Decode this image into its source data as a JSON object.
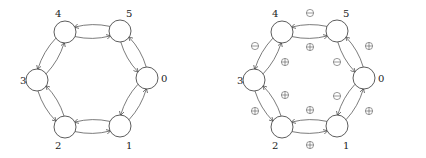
{
  "diagrams": [
    {
      "name": "unsigned-ring",
      "offset_x": 0,
      "nodes": [
        {
          "id": "0",
          "label": "0",
          "x": 147,
          "y": 78,
          "lx": 161,
          "ly": 82
        },
        {
          "id": "1",
          "label": "1",
          "x": 120,
          "y": 126,
          "lx": 126,
          "ly": 149
        },
        {
          "id": "2",
          "label": "2",
          "x": 65,
          "y": 127,
          "lx": 55,
          "ly": 149
        },
        {
          "id": "3",
          "label": "3",
          "x": 37,
          "y": 80,
          "lx": 20,
          "ly": 84
        },
        {
          "id": "4",
          "label": "4",
          "x": 65,
          "y": 32,
          "lx": 55,
          "ly": 17
        },
        {
          "id": "5",
          "label": "5",
          "x": 120,
          "y": 31,
          "lx": 126,
          "ly": 17
        }
      ],
      "edge_signs": []
    },
    {
      "name": "signed-ring",
      "offset_x": 217,
      "nodes": [
        {
          "id": "0",
          "label": "0",
          "x": 147,
          "y": 78,
          "lx": 161,
          "ly": 82
        },
        {
          "id": "1",
          "label": "1",
          "x": 120,
          "y": 126,
          "lx": 126,
          "ly": 149
        },
        {
          "id": "2",
          "label": "2",
          "x": 65,
          "y": 127,
          "lx": 55,
          "ly": 149
        },
        {
          "id": "3",
          "label": "3",
          "x": 37,
          "y": 80,
          "lx": 20,
          "ly": 84
        },
        {
          "id": "4",
          "label": "4",
          "x": 65,
          "y": 32,
          "lx": 55,
          "ly": 17
        },
        {
          "id": "5",
          "label": "5",
          "x": 120,
          "y": 31,
          "lx": 126,
          "ly": 17
        }
      ],
      "edge_signs": [
        {
          "edge": "4->5",
          "sign": "minus",
          "x": 93,
          "y": 13
        },
        {
          "edge": "5->4",
          "sign": "plus",
          "x": 93,
          "y": 47
        },
        {
          "edge": "5->0",
          "sign": "plus",
          "x": 152,
          "y": 46
        },
        {
          "edge": "0->5",
          "sign": "minus",
          "x": 120,
          "y": 62
        },
        {
          "edge": "0->1",
          "sign": "plus",
          "x": 152,
          "y": 111
        },
        {
          "edge": "1->0",
          "sign": "minus",
          "x": 120,
          "y": 96
        },
        {
          "edge": "2->1",
          "sign": "plus",
          "x": 93,
          "y": 110
        },
        {
          "edge": "1->2",
          "sign": "plus",
          "x": 93,
          "y": 145
        },
        {
          "edge": "3->2",
          "sign": "plus",
          "x": 68,
          "y": 95
        },
        {
          "edge": "2->3",
          "sign": "plus",
          "x": 38,
          "y": 111
        },
        {
          "edge": "4->3",
          "sign": "plus",
          "x": 68,
          "y": 62
        },
        {
          "edge": "3->4",
          "sign": "minus",
          "x": 38,
          "y": 46
        }
      ]
    }
  ]
}
